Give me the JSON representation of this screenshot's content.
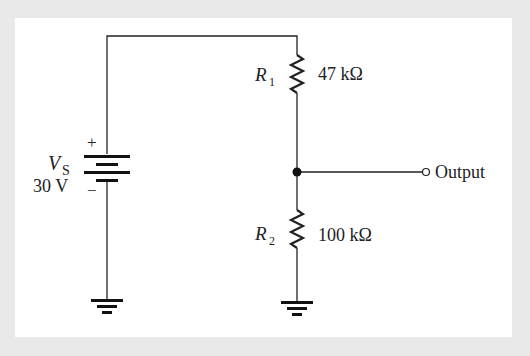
{
  "diagram": {
    "type": "voltage-divider-circuit",
    "source": {
      "name": "V",
      "subscript": "S",
      "value": "30 V",
      "plus": "+",
      "minus": "−"
    },
    "resistors": [
      {
        "name": "R",
        "subscript": "1",
        "value": "47 kΩ"
      },
      {
        "name": "R",
        "subscript": "2",
        "value": "100 kΩ"
      }
    ],
    "output_label": "Output",
    "colors": {
      "background": "#e9e9e9",
      "panel": "#ffffff",
      "line": "#222222"
    }
  }
}
